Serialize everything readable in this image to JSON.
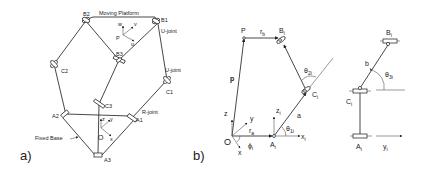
{
  "figure": {
    "panel_a": {
      "label": "a)",
      "title": "Moving Platform",
      "nodes": {
        "B1": "B1",
        "B2": "B2",
        "B3": "B3",
        "C1": "C1",
        "C2": "C2",
        "C3": "C3",
        "A1": "A1",
        "A2": "A2",
        "A3": "A3",
        "P": "P",
        "O": "O"
      },
      "annotations": {
        "ujoint_top": "U-joint",
        "ujoint_mid": "U-joint",
        "rjoint": "R-joint",
        "fixed_base": "Fixed Base"
      },
      "platform_axes": [
        "w",
        "v",
        "u"
      ],
      "base_axes": [
        "z",
        "y",
        "x"
      ]
    },
    "panel_b": {
      "label": "b)",
      "left": {
        "P": "P",
        "rb": "r",
        "rb_sub": "b",
        "Bi": "B",
        "Bi_sub": "i",
        "p": "p",
        "theta2i": "θ",
        "theta2i_sub": "2i",
        "Ci": "C",
        "Ci_sub": "i",
        "a": "a",
        "z": "z",
        "y": "y",
        "x": "x",
        "O": "O",
        "ra": "r",
        "ra_sub": "a",
        "phi": "ϕ",
        "phi_sub": "i",
        "zi": "z",
        "zi_sub": "i",
        "Ai": "A",
        "Ai_sub": "i",
        "theta1i": "θ",
        "theta1i_sub": "1i",
        "xi": "x",
        "xi_sub": "i"
      },
      "right": {
        "Bi": "B",
        "Bi_sub": "i",
        "b": "b",
        "theta3i": "θ",
        "theta3i_sub": "3i",
        "Ci": "C",
        "Ci_sub": "i",
        "Ai": "A",
        "Ai_sub": "i",
        "yi": "y",
        "yi_sub": "i"
      }
    }
  }
}
